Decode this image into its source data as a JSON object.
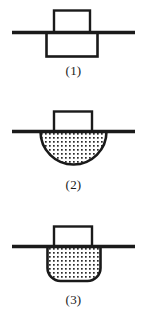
{
  "diagram": {
    "line_color": "#1a1a1a",
    "outline_color": "#1a1a1a",
    "fill_pattern_color": "#2b2b2b",
    "fill_background": "#ffffff",
    "figures": [
      {
        "id": "figure-1",
        "caption": "(1)",
        "shape_name": "rectangular-vessel-empty",
        "vessel_shape": "rectangle",
        "filled": false,
        "neck_label": "neck-rectangle",
        "surface_label": "horizontal-surface-line"
      },
      {
        "id": "figure-2",
        "caption": "(2)",
        "shape_name": "hemispherical-vessel-filled",
        "vessel_shape": "semicircle",
        "filled": true,
        "neck_label": "neck-rectangle",
        "surface_label": "horizontal-surface-line"
      },
      {
        "id": "figure-3",
        "caption": "(3)",
        "shape_name": "round-bottom-vessel-filled",
        "vessel_shape": "u-shape",
        "filled": true,
        "neck_label": "neck-rectangle",
        "surface_label": "horizontal-surface-line"
      }
    ]
  }
}
